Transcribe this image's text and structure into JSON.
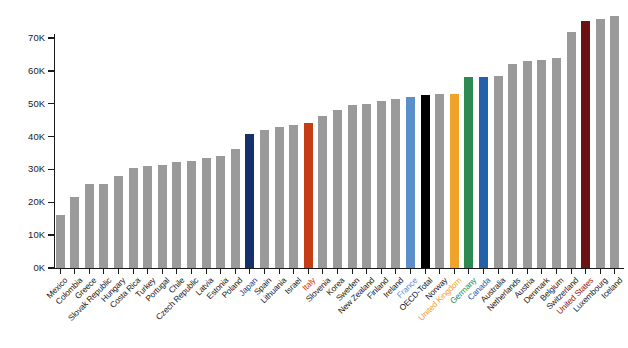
{
  "chart_data": {
    "type": "bar",
    "title": "",
    "subtitle": "",
    "xlabel": "",
    "ylabel": "",
    "ylim": [
      0,
      70000
    ],
    "grid": false,
    "legend": "none",
    "y_ticks": [
      "0K",
      "10K",
      "20K",
      "30K",
      "40K",
      "50K",
      "60K",
      "70K"
    ],
    "y_tick_values": [
      0,
      10000,
      20000,
      30000,
      40000,
      50000,
      60000,
      70000
    ],
    "default_bar_color": "#9a9a9a",
    "default_label_color": "#1a1a1a",
    "categories": [
      "Mexico",
      "Colombia",
      "Greece",
      "Slovak Republic",
      "Hungary",
      "Costa Rica",
      "Turkey",
      "Portugal",
      "Chile",
      "Czech Republic",
      "Latvia",
      "Estonia",
      "Poland",
      "Japan",
      "Spain",
      "Lithuania",
      "Israel",
      "Italy",
      "Slovenia",
      "Korea",
      "Sweden",
      "New Zealand",
      "Finland",
      "Ireland",
      "France",
      "OECD-Total",
      "Norway",
      "United Kingdom",
      "Germany",
      "Canada",
      "Australia",
      "Netherlands",
      "Austria",
      "Denmark",
      "Belgium",
      "Switzerland",
      "United States",
      "Luxembourg",
      "Iceland"
    ],
    "values": [
      16200,
      21600,
      25500,
      25700,
      27900,
      30500,
      31000,
      31300,
      32300,
      32700,
      33500,
      34000,
      36200,
      40700,
      42000,
      43000,
      43400,
      44100,
      46400,
      48100,
      49600,
      49900,
      50700,
      51400,
      51900,
      52600,
      52900,
      53100,
      58000,
      58100,
      58500,
      62200,
      62900,
      63200,
      63900,
      71900,
      75200,
      75800,
      76600
    ],
    "bar_colors": [
      "#9a9a9a",
      "#9a9a9a",
      "#9a9a9a",
      "#9a9a9a",
      "#9a9a9a",
      "#9a9a9a",
      "#9a9a9a",
      "#9a9a9a",
      "#9a9a9a",
      "#9a9a9a",
      "#9a9a9a",
      "#9a9a9a",
      "#9a9a9a",
      "#16306b",
      "#9a9a9a",
      "#9a9a9a",
      "#9a9a9a",
      "#c63c14",
      "#9a9a9a",
      "#9a9a9a",
      "#9a9a9a",
      "#9a9a9a",
      "#9a9a9a",
      "#9a9a9a",
      "#5b8fc9",
      "#000000",
      "#9a9a9a",
      "#f0a32a",
      "#2c8a52",
      "#2361a8",
      "#9a9a9a",
      "#9a9a9a",
      "#9a9a9a",
      "#9a9a9a",
      "#9a9a9a",
      "#9a9a9a",
      "#6b1212",
      "#9a9a9a",
      "#9a9a9a"
    ],
    "label_colors": [
      "#1a1a1a",
      "#1a1a1a",
      "#1a1a1a",
      "#1a1a1a",
      "#1a1a1a",
      "#1a1a1a",
      "#1a1a1a",
      "#1a1a1a",
      "#1a1a1a",
      "#1a1a1a",
      "#1a1a1a",
      "#1a1a1a",
      "#1a1a1a",
      "#2a3f8f",
      "#1a1a1a",
      "#1a1a1a",
      "#1a1a1a",
      "#c63c14",
      "#1a1a1a",
      "#1a1a1a",
      "#1a1a1a",
      "#1a1a1a",
      "#1a1a1a",
      "#1a1a1a",
      "#5b8fc9",
      "#1a1a1a",
      "#1a1a1a",
      "#f0a32a",
      "#2c8a52",
      "#2361a8",
      "#1a1a1a",
      "#1a1a1a",
      "#1a1a1a",
      "#1a1a1a",
      "#1a1a1a",
      "#1a1a1a",
      "#8b1a1a",
      "#1a1a1a",
      "#1a1a1a"
    ],
    "highlighted": [
      "Japan",
      "Italy",
      "France",
      "OECD-Total",
      "United Kingdom",
      "Germany",
      "Canada",
      "United States"
    ]
  }
}
